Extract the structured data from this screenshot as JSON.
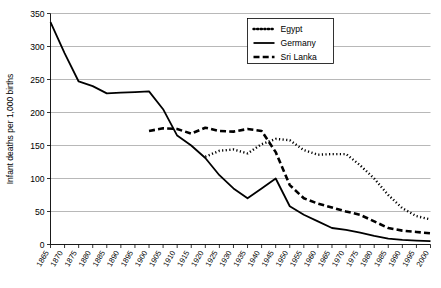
{
  "chart_data": {
    "type": "line",
    "title": "",
    "xlabel": "",
    "ylabel": "Infant deaths per 1,000 births",
    "ylim": [
      0,
      350
    ],
    "ytick_step": 50,
    "yticks": [
      "0",
      "50",
      "100",
      "150",
      "200",
      "250",
      "300",
      "350"
    ],
    "grid": true,
    "legend_position": "top-right",
    "x": [
      1865,
      1870,
      1875,
      1880,
      1885,
      1890,
      1895,
      1900,
      1905,
      1910,
      1915,
      1920,
      1925,
      1930,
      1935,
      1940,
      1945,
      1950,
      1955,
      1960,
      1965,
      1970,
      1975,
      1980,
      1985,
      1990,
      1995,
      2000
    ],
    "xticks": [
      "1865",
      "1870",
      "1875",
      "1880",
      "1885",
      "1890",
      "1895",
      "1900",
      "1905",
      "1910",
      "1915",
      "1920",
      "1925",
      "1930",
      "1935",
      "1940",
      "1945",
      "1950",
      "1955",
      "1960",
      "1965",
      "1970",
      "1975",
      "1980",
      "1985",
      "1990",
      "1995",
      "2000"
    ],
    "series": [
      {
        "name": "Egypt",
        "style": "dotted",
        "start_index": 11,
        "values": [
          null,
          null,
          null,
          null,
          null,
          null,
          null,
          null,
          null,
          null,
          null,
          133,
          142,
          144,
          138,
          152,
          160,
          158,
          143,
          136,
          137,
          137,
          120,
          100,
          75,
          55,
          43,
          38
        ]
      },
      {
        "name": "Germany",
        "style": "solid",
        "start_index": 0,
        "values": [
          337,
          290,
          247,
          240,
          229,
          230,
          231,
          232,
          205,
          165,
          150,
          131,
          105,
          85,
          70,
          85,
          100,
          58,
          45,
          35,
          25,
          22,
          18,
          13,
          9,
          7,
          6,
          5
        ]
      },
      {
        "name": "Sri Lanka",
        "style": "dashed",
        "start_index": 7,
        "values": [
          null,
          null,
          null,
          null,
          null,
          null,
          null,
          172,
          176,
          175,
          168,
          177,
          172,
          171,
          175,
          172,
          140,
          90,
          70,
          62,
          56,
          50,
          45,
          35,
          25,
          21,
          19,
          17
        ]
      }
    ]
  },
  "legend": {
    "entries": [
      {
        "label": "Egypt",
        "style": "dotted"
      },
      {
        "label": "Germany",
        "style": "solid"
      },
      {
        "label": "Sri Lanka",
        "style": "dashed"
      }
    ]
  }
}
